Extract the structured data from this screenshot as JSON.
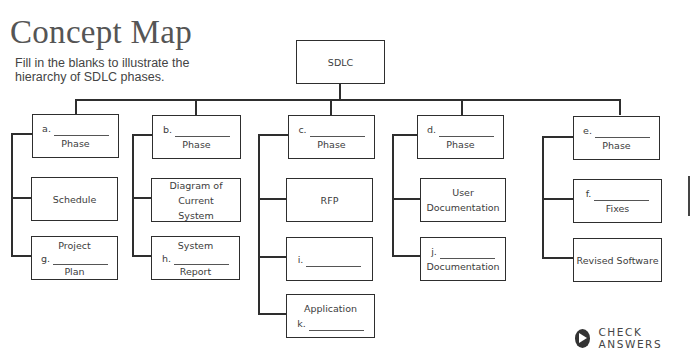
{
  "header": {
    "title": "Concept Map",
    "instructions": "Fill in the blanks to illustrate the hierarchy of SDLC phases."
  },
  "root": {
    "label": "SDLC"
  },
  "columns": [
    {
      "phase": {
        "letter": "a.",
        "label": "Phase"
      },
      "children": [
        {
          "text": "Schedule"
        },
        {
          "top": "Project",
          "letter": "g.",
          "bottom": "Plan"
        }
      ]
    },
    {
      "phase": {
        "letter": "b.",
        "label": "Phase"
      },
      "children": [
        {
          "top": "Diagram of Current",
          "bottom": "System"
        },
        {
          "top": "System",
          "letter": "h.",
          "bottom": "Report"
        }
      ]
    },
    {
      "phase": {
        "letter": "c.",
        "label": "Phase"
      },
      "children": [
        {
          "text": "RFP"
        },
        {
          "letter": "i."
        },
        {
          "top": "Application",
          "letter": "k."
        }
      ]
    },
    {
      "phase": {
        "letter": "d.",
        "label": "Phase"
      },
      "children": [
        {
          "top": "User",
          "bottom": "Documentation"
        },
        {
          "letter": "j.",
          "bottom": "Documentation"
        }
      ]
    },
    {
      "phase": {
        "letter": "e.",
        "label": "Phase"
      },
      "children": [
        {
          "letter": "f.",
          "bottom": "Fixes"
        },
        {
          "text": "Revised Software"
        }
      ]
    }
  ],
  "actions": {
    "check_answers": "CHECK ANSWERS"
  },
  "colors": {
    "line": "#2e2e2e",
    "text": "#3c3c3c",
    "title": "#555555"
  }
}
